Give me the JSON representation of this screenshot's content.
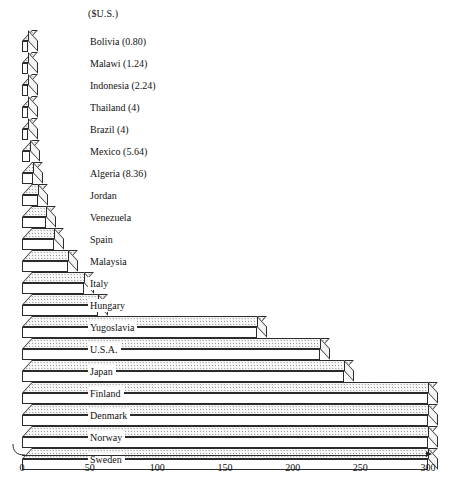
{
  "chart_data": {
    "type": "bar",
    "orientation": "horizontal",
    "style": "3d-prism",
    "title": "",
    "subtitle": "",
    "units_caption": "($U.S.)",
    "xlabel": "",
    "ylabel": "",
    "xlim": [
      0,
      300
    ],
    "grid": false,
    "legend": null,
    "tick_labels": [
      "0",
      "50",
      "100",
      "150",
      "200",
      "250",
      "300"
    ],
    "ticks": [
      0,
      50,
      100,
      150,
      200,
      250,
      300
    ],
    "categories": [
      "Bolivia (0.80)",
      "Malawi (1.24)",
      "Indonesia (2.24)",
      "Thailand (4)",
      "Brazil (4)",
      "Mexico (5.64)",
      "Algeria (8.36)",
      "Jordan",
      "Venezuela",
      "Spain",
      "Malaysia",
      "Italy",
      "Hungary",
      "Yugoslavia",
      "U.S.A.",
      "Japan",
      "Finland",
      "Denmark",
      "Norway",
      "Sweden"
    ],
    "values": [
      0.8,
      1.24,
      2.24,
      4,
      4,
      5.64,
      8.36,
      12,
      18,
      24,
      34,
      46,
      56,
      174,
      220,
      238,
      300,
      300,
      300,
      300
    ],
    "bars": [
      {
        "label": "Bolivia (0.80)",
        "value": 0.8,
        "value_text": "0.80"
      },
      {
        "label": "Malawi (1.24)",
        "value": 1.24,
        "value_text": "1.24"
      },
      {
        "label": "Indonesia (2.24)",
        "value": 2.24,
        "value_text": "2.24"
      },
      {
        "label": "Thailand (4)",
        "value": 4,
        "value_text": "4"
      },
      {
        "label": "Brazil (4)",
        "value": 4,
        "value_text": "4"
      },
      {
        "label": "Mexico (5.64)",
        "value": 5.64,
        "value_text": "5.64"
      },
      {
        "label": "Algeria (8.36)",
        "value": 8.36,
        "value_text": "8.36"
      },
      {
        "label": "Jordan",
        "value": 12,
        "value_text": ""
      },
      {
        "label": "Venezuela",
        "value": 18,
        "value_text": ""
      },
      {
        "label": "Spain",
        "value": 24,
        "value_text": ""
      },
      {
        "label": "Malaysia",
        "value": 34,
        "value_text": ""
      },
      {
        "label": "Italy",
        "value": 46,
        "value_text": ""
      },
      {
        "label": "Hungary",
        "value": 56,
        "value_text": ""
      },
      {
        "label": "Yugoslavia",
        "value": 174,
        "value_text": ""
      },
      {
        "label": "U.S.A.",
        "value": 220,
        "value_text": ""
      },
      {
        "label": "Japan",
        "value": 238,
        "value_text": ""
      },
      {
        "label": "Finland",
        "value": 300,
        "value_text": ""
      },
      {
        "label": "Denmark",
        "value": 300,
        "value_text": ""
      },
      {
        "label": "Norway",
        "value": 300,
        "value_text": ""
      },
      {
        "label": "Sweden",
        "value": 300,
        "value_text": ""
      }
    ],
    "colors": {
      "bar_outline": "#2b2b2b",
      "bar_front": "#ffffff",
      "bar_top_fill": "#fdfdfd",
      "bar_top_dots": "#8e8e8e",
      "bar_cap": "#f4f4f4",
      "axis": "#2b2b2b",
      "text": "#111111",
      "background": "#ffffff"
    }
  }
}
